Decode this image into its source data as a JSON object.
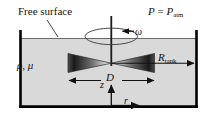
{
  "figure": {
    "colors": {
      "fluid_fill": "#d9d9d9",
      "wall": "#000000",
      "free_surface_line": "#555555",
      "blade_dark": "#121212",
      "blade_light": "#e8e8e8",
      "text": "#111111"
    },
    "labels": {
      "free_surface": "Free surface",
      "pressure_lhs": "P",
      "pressure_eq": " = ",
      "pressure_rhs": "P",
      "pressure_sub": "atm",
      "omega": "ω",
      "density_viscosity": "ρ, μ",
      "radius_sym": "R",
      "radius_sub": "tank",
      "diameter": "D",
      "axis_z": "z",
      "axis_r": "r"
    },
    "annotations": {
      "free_surface_leader": "line from label down-right to the liquid surface",
      "rotation_arrow_direction": "counterclockwise (arrowhead points left)",
      "diameter_arrow": "double-headed horizontal arrow spanning impeller width",
      "radius_arrow": "single arrow from shaft axis right to tank wall",
      "z_axis_arrow": "vertical arrow pointing up from tank floor",
      "r_axis_arrow": "horizontal arrow pointing right along tank floor"
    }
  }
}
